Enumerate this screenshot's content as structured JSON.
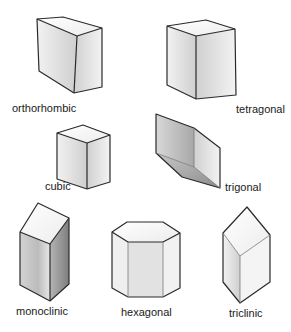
{
  "figure": {
    "crystals": [
      {
        "id": "orthorhombic",
        "label": "orthorhombic"
      },
      {
        "id": "tetragonal",
        "label": "tetragonal"
      },
      {
        "id": "cubic",
        "label": "cubic"
      },
      {
        "id": "trigonal",
        "label": "trigonal"
      },
      {
        "id": "monoclinic",
        "label": "monoclinic"
      },
      {
        "id": "hexagonal",
        "label": "hexagonal"
      },
      {
        "id": "triclinic",
        "label": "triclinic"
      }
    ],
    "colors": {
      "edge": "#2a2a2a",
      "face_light": "#f4f4f4",
      "face_mid": "#dcdcdc",
      "face_dark": "#9a9a9a",
      "background": "#ffffff"
    }
  }
}
